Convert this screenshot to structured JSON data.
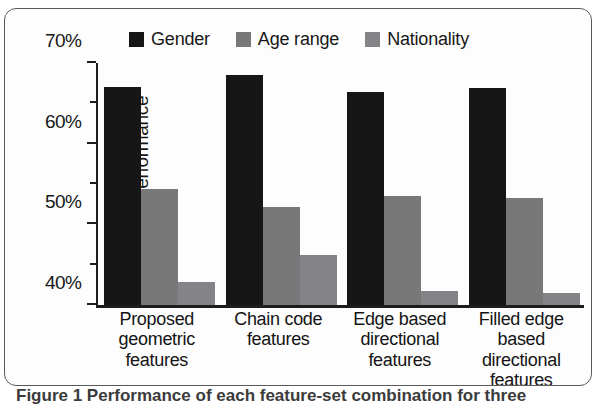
{
  "figure": {
    "frame_border_color": "#5a5a5a",
    "background": "#ffffff",
    "caption_partial": "Figure 1 Performance of each feature-set combination for three"
  },
  "legend": {
    "position": "top-center",
    "items": [
      {
        "label": "Gender",
        "color": "#161616",
        "icon": "legend-swatch-icon"
      },
      {
        "label": "Age range",
        "color": "#787878",
        "icon": "legend-swatch-icon"
      },
      {
        "label": "Nationality",
        "color": "#848488",
        "icon": "legend-swatch-icon"
      }
    ]
  },
  "axes": {
    "ylabel": "Average performance",
    "ytick_labels": [
      "70%",
      "60%",
      "50%",
      "40%"
    ],
    "ytick_values": [
      70,
      60,
      50,
      40
    ],
    "yminor_values": [
      65,
      55,
      45
    ],
    "ymin": 40,
    "ymax": 70
  },
  "chart_data": {
    "type": "bar",
    "title": "",
    "xlabel": "",
    "ylabel": "Average performance",
    "ylim": [
      40,
      70
    ],
    "ytick_labels": [
      "40%",
      "50%",
      "60%",
      "70%"
    ],
    "grid": false,
    "legend_position": "top-center",
    "categories": [
      "Proposed geometric features",
      "Chain code features",
      "Edge based directional features",
      "Filled edge based directional features"
    ],
    "category_label_lines": [
      [
        "Proposed",
        "geometric",
        "features"
      ],
      [
        "Chain code",
        "features"
      ],
      [
        "Edge based",
        "directional",
        "features"
      ],
      [
        "Filled edge",
        "based",
        "directional",
        "features"
      ]
    ],
    "series": [
      {
        "name": "Gender",
        "color": "#161616",
        "values": [
          67.0,
          68.5,
          66.4,
          66.9
        ]
      },
      {
        "name": "Age range",
        "color": "#787878",
        "values": [
          54.4,
          52.2,
          53.5,
          53.3
        ]
      },
      {
        "name": "Nationality",
        "color": "#848488",
        "values": [
          42.8,
          46.2,
          41.7,
          41.5
        ]
      }
    ],
    "units": "percent"
  }
}
